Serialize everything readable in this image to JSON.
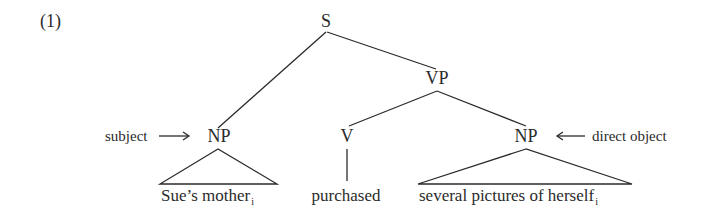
{
  "example_number": "(1)",
  "tree": {
    "root": {
      "label": "S"
    },
    "vp": {
      "label": "VP"
    },
    "subject_np": {
      "label": "NP",
      "annotation": "subject",
      "leaf": "Sue’s mother",
      "index": "i"
    },
    "verb": {
      "label": "V",
      "leaf": "purchased"
    },
    "object_np": {
      "label": "NP",
      "annotation": "direct object",
      "leaf": "several pictures of herself",
      "index": "i"
    }
  },
  "arrows": {
    "subject": "right-arrow",
    "object": "left-arrow"
  },
  "colors": {
    "ink": "#2b2b2b",
    "background": "#ffffff"
  }
}
